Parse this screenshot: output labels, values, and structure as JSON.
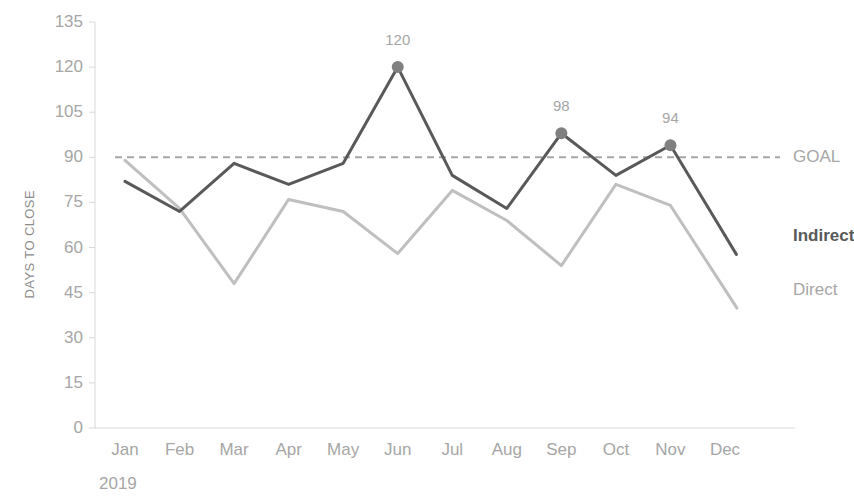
{
  "chart_data": {
    "type": "line",
    "title": "",
    "xlabel": "2019",
    "ylabel": "DAYS TO CLOSE",
    "categories": [
      "Jan",
      "Feb",
      "Mar",
      "Apr",
      "May",
      "Jun",
      "Jul",
      "Aug",
      "Sep",
      "Oct",
      "Nov",
      "Dec"
    ],
    "ylim": [
      0,
      135
    ],
    "yticks": [
      0,
      15,
      30,
      45,
      60,
      75,
      90,
      105,
      120,
      135
    ],
    "grid": false,
    "legend_position": "right-inline",
    "series": [
      {
        "name": "Indirect",
        "color": "#595959",
        "bold_label": true,
        "values": [
          82,
          72,
          88,
          81,
          88,
          120,
          84,
          73,
          98,
          84,
          94,
          64
        ],
        "marked_points": [
          {
            "category": "Jun",
            "value": 120,
            "label": "120"
          },
          {
            "category": "Sep",
            "value": 98,
            "label": "98"
          },
          {
            "category": "Nov",
            "value": 94,
            "label": "94"
          }
        ]
      },
      {
        "name": "Direct",
        "color": "#bfbfbf",
        "bold_label": false,
        "values": [
          89,
          73,
          48,
          76,
          72,
          58,
          79,
          69,
          54,
          81,
          74,
          46
        ],
        "marked_points": []
      }
    ],
    "reference_lines": [
      {
        "name": "GOAL",
        "value": 90,
        "color": "#a6a6a6",
        "style": "dashed"
      }
    ]
  },
  "labels": {
    "y_axis_title": "DAYS TO CLOSE",
    "year": "2019",
    "goal": "GOAL",
    "indirect": "Indirect",
    "direct": "Direct"
  },
  "colors": {
    "indirect_line": "#595959",
    "direct_line": "#bfbfbf",
    "goal_line": "#a6a6a6",
    "marker": "#808080",
    "axis": "#d9d9d9",
    "tick_text": "#a6a6a6",
    "axis_title_text": "#8c8c8c",
    "background": "#ffffff"
  }
}
